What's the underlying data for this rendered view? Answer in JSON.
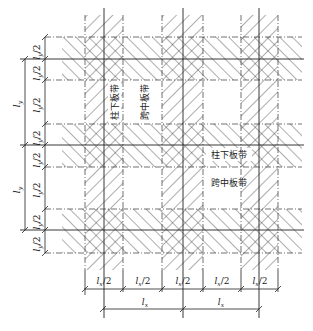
{
  "diagram": {
    "type": "flat-slab strip division",
    "labels": {
      "column_strip": "柱下板带",
      "middle_strip": "跨中板带"
    },
    "left_dimensions": {
      "half_labels": [
        "l_y/2",
        "l_y/2",
        "l_y/2",
        "l_y/2",
        "l_y/2",
        "l_y/2"
      ],
      "half_label_text": "l",
      "half_label_sub": "y",
      "half_label_suffix": "/2",
      "span_labels": [
        "l_y",
        "l_y"
      ],
      "span_text": "l",
      "span_sub": "y"
    },
    "bottom_dimensions": {
      "half_labels": [
        "l_x/2",
        "l_x/2",
        "l_x/2",
        "l_x/2",
        "l_x/2"
      ],
      "half_label_text": "l",
      "half_label_sub": "x",
      "half_label_suffix": "/2",
      "span_labels": [
        "l_x",
        "l_x"
      ],
      "span_text": "l",
      "span_sub": "x"
    },
    "column_strips_x": [
      [
        85,
        123
      ],
      [
        162,
        203
      ],
      [
        241,
        278
      ]
    ],
    "column_centers_x": [
      104,
      183,
      259
    ],
    "row_strips_y": [
      [
        37,
        80
      ],
      [
        124,
        167
      ],
      [
        209,
        253
      ]
    ],
    "row_centers_y": [
      59,
      145,
      230
    ],
    "line_color": "#333333"
  }
}
